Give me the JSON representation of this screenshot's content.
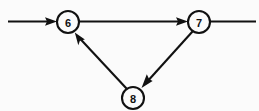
{
  "diagram": {
    "type": "directed-graph",
    "background_color": "#fbfbfb",
    "line_color": "#111111",
    "node_radius": 11,
    "nodes": [
      {
        "id": "6",
        "label": "6",
        "cx": 68,
        "cy": 22
      },
      {
        "id": "7",
        "label": "7",
        "cx": 199,
        "cy": 22
      },
      {
        "id": "8",
        "label": "8",
        "cx": 133,
        "cy": 98
      }
    ],
    "edges": [
      {
        "id": "in-6",
        "from": "external-left",
        "to": "6",
        "arrow": true,
        "label": ""
      },
      {
        "id": "6-7",
        "from": "6",
        "to": "7",
        "arrow": true,
        "label": ""
      },
      {
        "id": "7-8",
        "from": "7",
        "to": "8",
        "arrow": true,
        "label": ""
      },
      {
        "id": "8-6",
        "from": "8",
        "to": "6",
        "arrow": true,
        "label": ""
      },
      {
        "id": "7-out",
        "from": "7",
        "to": "external-right",
        "arrow": false,
        "label": ""
      }
    ]
  }
}
